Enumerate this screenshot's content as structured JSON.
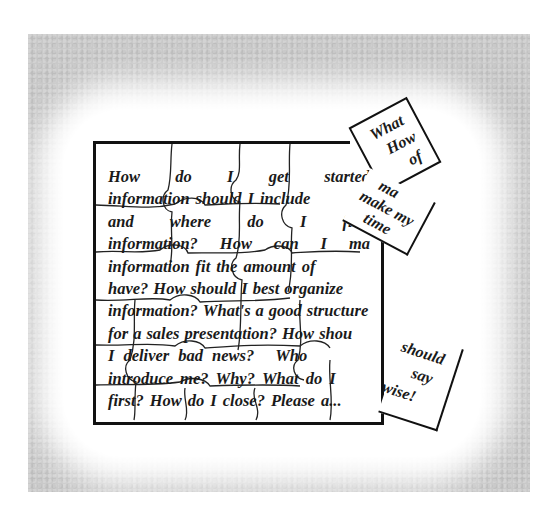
{
  "image": {
    "description": "Jigsaw puzzle illustration with presentation questions printed across the pieces",
    "background_color": "#c9c9c9",
    "ink_color": "#1a1a1a"
  },
  "puzzle": {
    "lines": [
      [
        "How",
        "do",
        "I",
        "get",
        "started"
      ],
      [
        "information",
        "should",
        "I",
        "include"
      ],
      [
        "and",
        "where",
        "do",
        "I",
        "find"
      ],
      [
        "information?",
        "How",
        "can",
        "I",
        "ma"
      ],
      [
        "information",
        "fit",
        "the",
        "amount",
        "of"
      ],
      [
        "have?",
        "How",
        "should",
        "I",
        "best",
        "organize"
      ],
      [
        "information?",
        "What's",
        "a",
        "good",
        "structure"
      ],
      [
        "for",
        "a",
        "sales",
        "presentation?",
        "How",
        "shou"
      ],
      [
        "I",
        "deliver",
        "bad",
        "news?",
        "Who"
      ],
      [
        "introduce",
        "me?",
        "Why?",
        "What",
        "do",
        "I"
      ],
      [
        "first?",
        "How",
        "do",
        "I",
        "close?",
        "Please",
        "a..."
      ]
    ],
    "loose_pieces": [
      {
        "words": [
          "What",
          "How",
          "of"
        ]
      },
      {
        "words": [
          "ma",
          "ke",
          "make my",
          "time",
          "I"
        ]
      },
      {
        "words": [
          "should",
          "say",
          "wise!"
        ]
      }
    ]
  }
}
